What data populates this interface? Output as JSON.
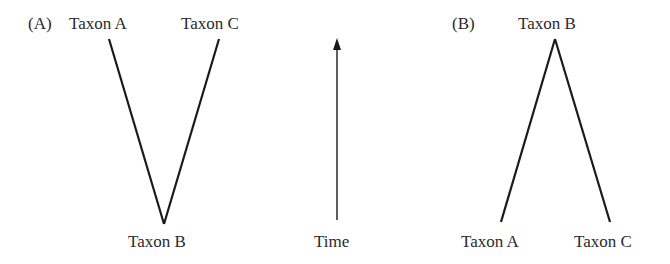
{
  "panel_a": {
    "label": "(A)",
    "top_left": "Taxon A",
    "top_right": "Taxon C",
    "bottom": "Taxon B"
  },
  "time_axis": {
    "label": "Time",
    "direction": "up"
  },
  "panel_b": {
    "label": "(B)",
    "top": "Taxon B",
    "bottom_left": "Taxon A",
    "bottom_right": "Taxon C"
  },
  "colors": {
    "line": "#1a1a1a",
    "text": "#2a2a2a"
  }
}
